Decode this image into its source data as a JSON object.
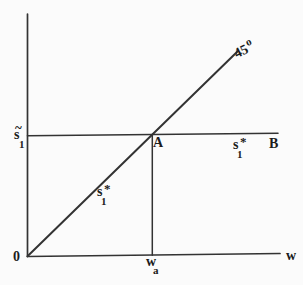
{
  "figure": {
    "background_color": "#fbfbfb",
    "line_color": "#333333",
    "text_color": "#1c1c1c",
    "labels": {
      "angle_45": {
        "base": "45",
        "sup": "o"
      },
      "s_tilde_1": {
        "accent": "~",
        "base": "s",
        "sub": "1"
      },
      "point_a": "A",
      "point_b": "B",
      "s1_star_on_line": {
        "base": "s",
        "sup": "*",
        "sub": "1"
      },
      "s1_star_region": {
        "base": "s",
        "sup": "*",
        "sub": "1"
      },
      "origin": "0",
      "w_a": {
        "base": "w",
        "sub": "a"
      },
      "w_axis": "w"
    }
  }
}
